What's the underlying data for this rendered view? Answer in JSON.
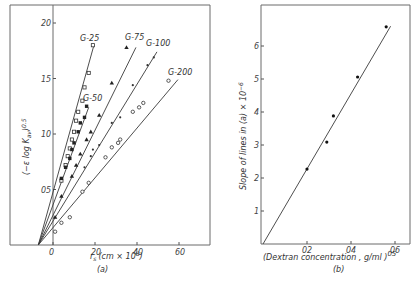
{
  "chart_data": [
    {
      "panel": "(a)",
      "type": "scatter",
      "title": "",
      "xlabel": "r_s (cm × 10^8)",
      "ylabel": "(−ε log K_av)^0.5",
      "xlim": [
        -20,
        75
      ],
      "ylim": [
        0,
        2.2
      ],
      "xticks": [
        0,
        20,
        40,
        60
      ],
      "xtick_labels": [
        "0",
        "20",
        "40",
        "60"
      ],
      "yticks": [
        0.5,
        1.0,
        1.5,
        2.0
      ],
      "ytick_labels": [
        "05",
        "10",
        "15",
        "20"
      ],
      "grid": false,
      "legend": "inline labels at line ends",
      "common_intercept_x": -7,
      "series": [
        {
          "name": "G-25",
          "marker": "open-square",
          "line": [
            [
              -7,
              0
            ],
            [
              19.5,
              1.8
            ]
          ],
          "points": [
            [
              4,
              0.58
            ],
            [
              6,
              0.72
            ],
            [
              7,
              0.8
            ],
            [
              8,
              0.87
            ],
            [
              9,
              0.95
            ],
            [
              10,
              1.02
            ],
            [
              11,
              1.12
            ],
            [
              12,
              1.2
            ],
            [
              14,
              1.3
            ],
            [
              15,
              1.42
            ],
            [
              17,
              1.55
            ],
            [
              19,
              1.8
            ]
          ]
        },
        {
          "name": "G-50",
          "marker": "filled-square",
          "line": [
            [
              -7,
              0
            ],
            [
              17,
              1.24
            ]
          ],
          "points": [
            [
              4,
              0.6
            ],
            [
              6,
              0.7
            ],
            [
              8,
              0.78
            ],
            [
              9,
              0.86
            ],
            [
              10,
              0.92
            ],
            [
              12,
              1.02
            ],
            [
              13,
              1.1
            ],
            [
              15,
              1.15
            ],
            [
              16,
              1.25
            ]
          ]
        },
        {
          "name": "G-75",
          "marker": "triangle",
          "line": [
            [
              -7,
              0
            ],
            [
              39.5,
              1.78
            ]
          ],
          "points": [
            [
              1,
              0.25
            ],
            [
              4,
              0.44
            ],
            [
              9,
              0.62
            ],
            [
              11,
              0.72
            ],
            [
              13,
              0.82
            ],
            [
              16,
              0.95
            ],
            [
              18,
              1.02
            ],
            [
              22,
              1.17
            ],
            [
              28,
              1.46
            ],
            [
              35,
              1.78
            ]
          ]
        },
        {
          "name": "G-100",
          "marker": "small-dot",
          "line": [
            [
              -7,
              0
            ],
            [
              49.5,
              1.74
            ]
          ],
          "points": [
            [
              15,
              0.7
            ],
            [
              18,
              0.8
            ],
            [
              19,
              0.86
            ],
            [
              22,
              0.9
            ],
            [
              28,
              1.1
            ],
            [
              32,
              1.15
            ],
            [
              38,
              1.44
            ],
            [
              45,
              1.62
            ],
            [
              48,
              1.69
            ]
          ]
        },
        {
          "name": "G-200",
          "marker": "open-and-filled-circle",
          "line": [
            [
              -7,
              0
            ],
            [
              59.5,
              1.49
            ]
          ],
          "points": [
            [
              1,
              0.12
            ],
            [
              4,
              0.2
            ],
            [
              8,
              0.25
            ],
            [
              14,
              0.48
            ],
            [
              17,
              0.56
            ],
            [
              25,
              0.79
            ],
            [
              28,
              0.88
            ],
            [
              31,
              0.92
            ],
            [
              32,
              0.95
            ],
            [
              38,
              1.2
            ],
            [
              41,
              1.24
            ],
            [
              43,
              1.28
            ],
            [
              55,
              1.48
            ]
          ]
        }
      ]
    },
    {
      "panel": "(b)",
      "type": "scatter",
      "title": "",
      "xlabel": "(Dextran concentration, g/ml)^0.5",
      "ylabel": "Slope of lines in (a) × 10^-6",
      "xlim": [
        0,
        0.7
      ],
      "ylim": [
        0,
        7
      ],
      "xticks": [
        0.2,
        0.4,
        0.6
      ],
      "xtick_labels": [
        "02",
        "04",
        "06"
      ],
      "yticks": [
        1,
        2,
        3,
        4,
        5,
        6
      ],
      "ytick_labels": [
        "1",
        "2",
        "3",
        "4",
        "5",
        "6"
      ],
      "grid": false,
      "series": [
        {
          "name": "slopes",
          "marker": "filled-circle",
          "x": [
            0.2,
            0.29,
            0.32,
            0.43,
            0.56
          ],
          "y": [
            2.27,
            3.09,
            3.88,
            5.06,
            6.58
          ],
          "line": [
            [
              0,
              0
            ],
            [
              0.58,
              6.6
            ]
          ]
        }
      ]
    }
  ],
  "labels": {
    "panel_a": "(a)",
    "panel_b": "(b)",
    "a_xlabel_main": "r",
    "a_xlabel_sub": "s",
    "a_xlabel_rest": "(cm × 10",
    "a_xlabel_exp": "8",
    "a_xlabel_close": ")",
    "a_ylabel": "(−ε log K",
    "a_ylabel_sub": "av",
    "a_ylabel_close": ")",
    "a_ylabel_exp": "0.5",
    "b_xlabel": "(Dextran  concentration , g/ml )",
    "b_xlabel_exp": "05",
    "b_ylabel": "Slope  of  lines  in (a) × 10",
    "b_ylabel_exp": "−6"
  }
}
